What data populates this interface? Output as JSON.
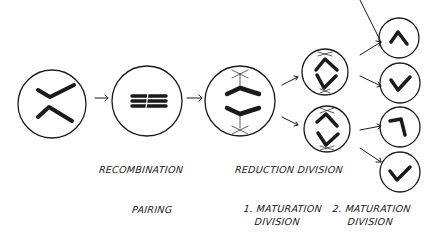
{
  "diagram": {
    "type": "hand-drawn process sketch of meiosis",
    "colors": {
      "ink": "#1a1a1a",
      "background": "#ffffff"
    },
    "stages": [
      {
        "id": "start",
        "description": "cell with two separate chromosomes (V and inverted V)"
      },
      {
        "id": "pairing",
        "description": "cell with paired chromosomes stacked horizontally"
      },
      {
        "id": "reduction",
        "description": "cell with two bent chromosomes attached to spindle poles"
      },
      {
        "id": "meiosis-i-products",
        "description": "two cells each with a diamond-shaped pair of chromatids and spindle poles"
      },
      {
        "id": "meiosis-ii-products",
        "description": "four cells each with a single bent chromatid"
      }
    ],
    "labels": {
      "recombination": "RECOMBINATION",
      "reduction_division": "REDUCTION DIVISION",
      "pairing": "PAIRING",
      "maturation1_line1": "1. MATURATION",
      "maturation1_line2": "DIVISION",
      "maturation2_line1": "2. MATURATION",
      "maturation2_line2": "DIVISION"
    }
  }
}
